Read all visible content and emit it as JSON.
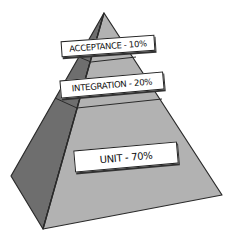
{
  "diagram": {
    "type": "test-pyramid",
    "layers": [
      {
        "name": "ACCEPTANCE",
        "percent": "10%",
        "label": "ACCEPTANCE - 10%"
      },
      {
        "name": "INTEGRATION",
        "percent": "20%",
        "label": "INTEGRATION - 20%"
      },
      {
        "name": "UNIT",
        "percent": "70%",
        "label": "UNIT - 70%"
      }
    ],
    "colors": {
      "front_face": "#b2b2b2",
      "side_face": "#6e6e6e",
      "outline": "#2a2a2a",
      "label_bg": "#ffffff"
    }
  }
}
